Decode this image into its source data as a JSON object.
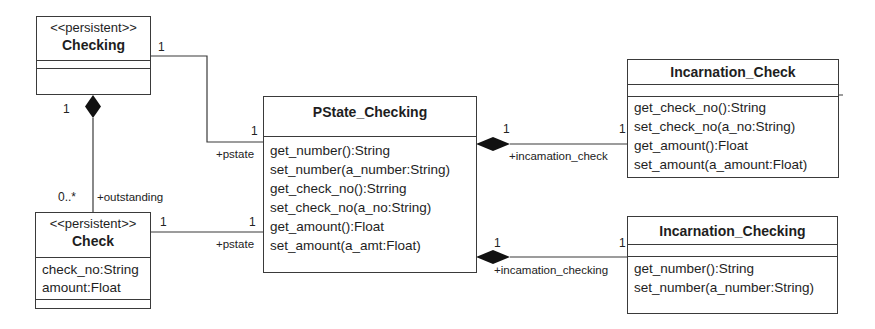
{
  "classes": {
    "checking": {
      "stereotype": "<<persistent>>",
      "name": "Checking",
      "attributes": [],
      "operations": []
    },
    "check": {
      "stereotype": "<<persistent>>",
      "name": "Check",
      "attributes": [
        "check_no:String",
        "amount:Float"
      ],
      "operations": []
    },
    "pstate_checking": {
      "name": "PState_Checking",
      "operations": [
        "get_number():String",
        "set_number(a_number:String)",
        "get_check_no():Strring",
        "set_check_no(a_no:String)",
        "get_amount():Float",
        "set_amount(a_amt:Float)"
      ]
    },
    "incarnation_check": {
      "name": "Incarnation_Check",
      "attributes": [],
      "operations": [
        "get_check_no():String",
        "set_check_no(a_no:String)",
        "get_amount():Float",
        "set_amount(a_amount:Float)"
      ]
    },
    "incarnation_checking": {
      "name": "Incarnation_Checking",
      "attributes": [],
      "operations": [
        "get_number():String",
        "set_number(a_number:String)"
      ]
    }
  },
  "associations": {
    "checking_pstate": {
      "mult_source": "1",
      "mult_target": "1",
      "role": "+pstate"
    },
    "check_pstate": {
      "mult_source": "1",
      "mult_target": "1",
      "role": "+pstate"
    },
    "checking_check": {
      "mult_source": "1",
      "mult_target": "0..*",
      "role": "+outstanding",
      "kind": "composition"
    },
    "pstate_incarnation_check": {
      "mult_source": "1",
      "mult_target": "1",
      "role": "+incamation_check",
      "kind": "composition"
    },
    "pstate_incarnation_checking": {
      "mult_source": "1",
      "mult_target": "1",
      "role": "+incamation_checking",
      "kind": "composition"
    }
  },
  "colors": {
    "line": "#3a3a3a",
    "text": "#1e1e1e",
    "background": "#ffffff"
  }
}
